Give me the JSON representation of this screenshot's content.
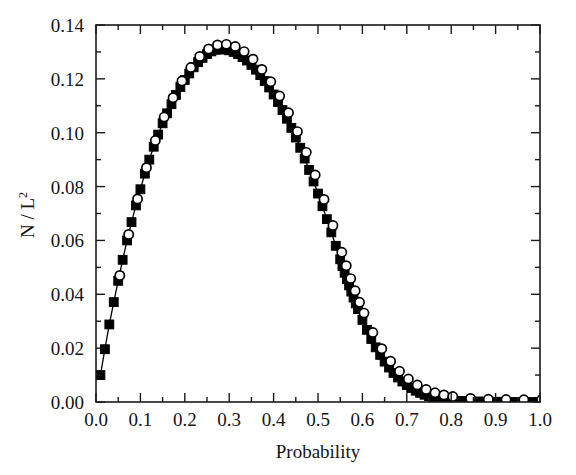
{
  "chart_data": {
    "type": "scatter",
    "title": "",
    "xlabel": "Probability",
    "ylabel": "N / L²",
    "ylabel_base": "N / L",
    "ylabel_exponent": "2",
    "xlim": [
      0.0,
      1.0
    ],
    "ylim": [
      0.0,
      0.14
    ],
    "xticks": [
      0.0,
      0.1,
      0.2,
      0.3,
      0.4,
      0.5,
      0.6,
      0.7,
      0.8,
      0.9,
      1.0
    ],
    "xticklabels": [
      "0.0",
      "0.1",
      "0.2",
      "0.3",
      "0.4",
      "0.5",
      "0.6",
      "0.7",
      "0.8",
      "0.9",
      "1.0"
    ],
    "yticks": [
      0.0,
      0.02,
      0.04,
      0.06,
      0.08,
      0.1,
      0.12,
      0.14
    ],
    "yticklabels": [
      "0.00",
      "0.02",
      "0.04",
      "0.06",
      "0.08",
      "0.10",
      "0.12",
      "0.14"
    ],
    "x_minor_tick_interval": 0.05,
    "y_minor_tick_interval": 0.01,
    "grid": false,
    "legend": null,
    "frame": "box-all-four-sides",
    "ticks_direction": "inward",
    "series": [
      {
        "name": "filled-squares",
        "marker": "square",
        "marker_style": "filled",
        "color": "#000000",
        "connected_by_line": true,
        "x": [
          0.01,
          0.02,
          0.03,
          0.04,
          0.05,
          0.06,
          0.07,
          0.08,
          0.09,
          0.1,
          0.11,
          0.12,
          0.13,
          0.14,
          0.15,
          0.16,
          0.17,
          0.18,
          0.19,
          0.2,
          0.21,
          0.22,
          0.23,
          0.24,
          0.25,
          0.26,
          0.27,
          0.28,
          0.29,
          0.3,
          0.31,
          0.32,
          0.33,
          0.34,
          0.35,
          0.36,
          0.37,
          0.38,
          0.39,
          0.4,
          0.41,
          0.42,
          0.43,
          0.44,
          0.45,
          0.46,
          0.47,
          0.48,
          0.49,
          0.5,
          0.51,
          0.52,
          0.53,
          0.54,
          0.55,
          0.555,
          0.56,
          0.565,
          0.57,
          0.575,
          0.58,
          0.585,
          0.59,
          0.6,
          0.61,
          0.62,
          0.63,
          0.64,
          0.65,
          0.66,
          0.67,
          0.68,
          0.69,
          0.7,
          0.71,
          0.72,
          0.73,
          0.74,
          0.75,
          0.76,
          0.77,
          0.78,
          0.79,
          0.8,
          0.82,
          0.84,
          0.86,
          0.88,
          0.9,
          0.92,
          0.94,
          0.96,
          0.98,
          1.0
        ],
        "y": [
          0.01,
          0.0196,
          0.0288,
          0.0371,
          0.045,
          0.0528,
          0.06,
          0.0668,
          0.073,
          0.079,
          0.0848,
          0.09,
          0.0948,
          0.0993,
          0.1035,
          0.1072,
          0.1106,
          0.114,
          0.117,
          0.1196,
          0.122,
          0.1243,
          0.1262,
          0.1278,
          0.1292,
          0.1302,
          0.1308,
          0.131,
          0.1309,
          0.1306,
          0.13,
          0.1292,
          0.1281,
          0.1268,
          0.1252,
          0.1234,
          0.1214,
          0.1192,
          0.1168,
          0.1142,
          0.1114,
          0.1084,
          0.1052,
          0.1018,
          0.0982,
          0.0944,
          0.0904,
          0.0862,
          0.0819,
          0.0774,
          0.0727,
          0.0679,
          0.063,
          0.058,
          0.053,
          0.0505,
          0.048,
          0.0456,
          0.0433,
          0.041,
          0.0388,
          0.0366,
          0.0345,
          0.0305,
          0.0268,
          0.0234,
          0.0203,
          0.0175,
          0.015,
          0.0128,
          0.0108,
          0.0091,
          0.0076,
          0.0063,
          0.0052,
          0.0042,
          0.0034,
          0.0027,
          0.0022,
          0.0017,
          0.0013,
          0.001,
          0.0008,
          0.0006,
          0.0004,
          0.0003,
          0.0002,
          0.0001,
          0.0001,
          0.0,
          0.0,
          0.0,
          0.0,
          0.0
        ]
      },
      {
        "name": "open-circles",
        "marker": "circle",
        "marker_style": "open",
        "color": "#000000",
        "connected_by_line": false,
        "x_offset_note": "slightly above/right of squares in upper-right branch",
        "x": [
          0.05,
          0.07,
          0.09,
          0.11,
          0.13,
          0.15,
          0.17,
          0.19,
          0.21,
          0.23,
          0.25,
          0.27,
          0.29,
          0.31,
          0.33,
          0.35,
          0.37,
          0.39,
          0.41,
          0.43,
          0.45,
          0.47,
          0.49,
          0.51,
          0.53,
          0.55,
          0.56,
          0.57,
          0.58,
          0.59,
          0.6,
          0.62,
          0.64,
          0.66,
          0.68,
          0.7,
          0.72,
          0.74,
          0.76,
          0.78,
          0.8,
          0.84,
          0.88,
          0.92,
          0.96,
          1.0
        ],
        "y": [
          0.0462,
          0.0614,
          0.0746,
          0.0862,
          0.0963,
          0.105,
          0.1122,
          0.1184,
          0.1234,
          0.1275,
          0.1303,
          0.1318,
          0.132,
          0.1312,
          0.1293,
          0.1265,
          0.1227,
          0.1181,
          0.1128,
          0.1066,
          0.0996,
          0.0919,
          0.0835,
          0.0744,
          0.0647,
          0.0548,
          0.0498,
          0.045,
          0.0405,
          0.0362,
          0.0322,
          0.025,
          0.019,
          0.0143,
          0.0106,
          0.0077,
          0.0055,
          0.0038,
          0.0026,
          0.0018,
          0.0012,
          0.0005,
          0.0002,
          0.0001,
          0.0,
          0.0
        ]
      }
    ]
  },
  "geometry": {
    "plot_left": 96,
    "plot_right": 540,
    "plot_top": 25,
    "plot_bottom": 402
  }
}
